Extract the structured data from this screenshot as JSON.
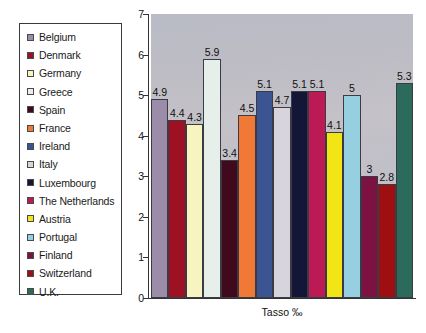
{
  "chart": {
    "type": "bar",
    "x_axis_title": "Tasso ‰",
    "y_axis": {
      "min": 0,
      "max": 7,
      "ticks": [
        "0",
        "1",
        "2",
        "3",
        "4",
        "5",
        "6",
        "7"
      ]
    }
  },
  "chart_data": {
    "type": "bar",
    "title": "",
    "subtitle": "",
    "xlabel": "Tasso ‰",
    "ylabel": "",
    "ylim": [
      0,
      7
    ],
    "yticks": [
      0,
      1,
      2,
      3,
      4,
      5,
      6,
      7
    ],
    "grid": false,
    "legend_position": "left-outside",
    "categories": [
      "Belgium",
      "Denmark",
      "Germany",
      "Greece",
      "Spain",
      "France",
      "Ireland",
      "Italy",
      "Luxembourg",
      "The Netherlands",
      "Austria",
      "Portugal",
      "Finland",
      "Switzerland",
      "U.K."
    ],
    "values": [
      4.9,
      4.4,
      4.3,
      5.9,
      3.4,
      4.5,
      5.1,
      4.7,
      5.1,
      5.1,
      4.1,
      5,
      3,
      2.8,
      5.3
    ],
    "value_labels": [
      "4.9",
      "4.4",
      "4.3",
      "5.9",
      "3.4",
      "4.5",
      "5.1",
      "4.7",
      "5.1",
      "5.1",
      "4.1",
      "5",
      "3",
      "2.8",
      "5.3"
    ],
    "colors": [
      "#9b8ca8",
      "#9e1122",
      "#f7f4c0",
      "#e6efe9",
      "#400a1c",
      "#f07a35",
      "#3a5591",
      "#d7d4dc",
      "#141637",
      "#bc1a55",
      "#f2e515",
      "#95cfe0",
      "#7c1241",
      "#9e0f12",
      "#2c6b5c"
    ]
  },
  "legend": {
    "items": [
      {
        "label": "Belgium",
        "color": "#9b8ca8"
      },
      {
        "label": "Denmark",
        "color": "#9e1122"
      },
      {
        "label": "Germany",
        "color": "#f7f4c0"
      },
      {
        "label": "Greece",
        "color": "#e6efe9"
      },
      {
        "label": "Spain",
        "color": "#400a1c"
      },
      {
        "label": "France",
        "color": "#f07a35"
      },
      {
        "label": "Ireland",
        "color": "#3a5591"
      },
      {
        "label": "Italy",
        "color": "#d7d4dc"
      },
      {
        "label": "Luxembourg",
        "color": "#141637"
      },
      {
        "label": "The Netherlands",
        "color": "#bc1a55"
      },
      {
        "label": "Austria",
        "color": "#f2e515"
      },
      {
        "label": "Portugal",
        "color": "#95cfe0"
      },
      {
        "label": "Finland",
        "color": "#7c1241"
      },
      {
        "label": "Switzerland",
        "color": "#9e0f12"
      },
      {
        "label": "U.K.",
        "color": "#2c6b5c"
      }
    ]
  }
}
